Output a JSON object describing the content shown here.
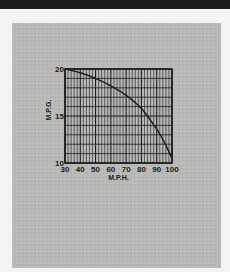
{
  "chart_data": {
    "type": "line",
    "title": "",
    "xlabel": "M.P.H.",
    "ylabel": "M.P.G.",
    "xlim": [
      30,
      100
    ],
    "ylim": [
      10,
      20
    ],
    "x_ticks": [
      30,
      40,
      50,
      60,
      70,
      80,
      90,
      100
    ],
    "y_ticks": [
      10,
      15,
      20
    ],
    "grid": true,
    "legend": null,
    "series": [
      {
        "name": "M.P.G. vs M.P.H.",
        "x": [
          30,
          40,
          50,
          60,
          70,
          80,
          90,
          95,
          100
        ],
        "values": [
          20,
          19.6,
          19.0,
          18.2,
          17.2,
          15.8,
          13.6,
          12.2,
          10.5
        ]
      }
    ]
  },
  "colors": {
    "page_background": "#f4f4f2",
    "top_band": "#1c1c1c",
    "panel": "#b9b9b6",
    "ink": "#1a1a1a"
  }
}
